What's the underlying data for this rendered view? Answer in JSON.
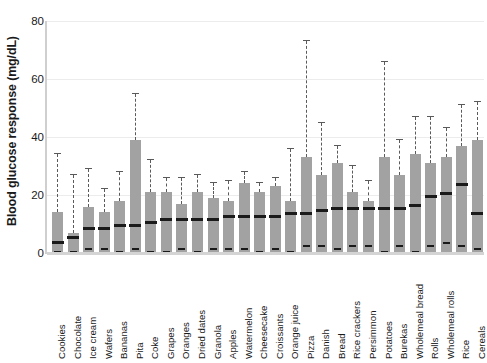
{
  "chart_data": {
    "type": "box",
    "title": "",
    "xlabel": "",
    "ylabel": "Blood glucose response (mg/dL)",
    "ylim": [
      0,
      80
    ],
    "yticks": [
      0,
      20,
      40,
      60,
      80
    ],
    "grid": true,
    "legend": null,
    "orientation": "vertical",
    "categories": [
      "Cookies",
      "Chocolate",
      "Ice cream",
      "Wafers",
      "Bananas",
      "Pita",
      "Coke",
      "Grapes",
      "Oranges",
      "Dried dates",
      "Granola",
      "Apples",
      "Watermelon",
      "Cheesecake",
      "Croissants",
      "Orange juice",
      "Pizza",
      "Danish",
      "Bread",
      "Rice crackers",
      "Persimmon",
      "Potatoes",
      "Burekas",
      "Wholemeal bread",
      "Rolls",
      "Wholemeal rolls",
      "Rice",
      "Cereals"
    ],
    "boxes": [
      {
        "label": "Cookies",
        "whisker_low": 0,
        "q1": 0,
        "median": 3,
        "q3": 14,
        "whisker_high": 34
      },
      {
        "label": "Chocolate",
        "whisker_low": 0,
        "q1": 0,
        "median": 5,
        "q3": 7,
        "whisker_high": 27
      },
      {
        "label": "Ice cream",
        "whisker_low": 1,
        "q1": 0,
        "median": 8,
        "q3": 16,
        "whisker_high": 29
      },
      {
        "label": "Wafers",
        "whisker_low": 1,
        "q1": 0,
        "median": 8,
        "q3": 14,
        "whisker_high": 22
      },
      {
        "label": "Bananas",
        "whisker_low": 0,
        "q1": 0,
        "median": 9,
        "q3": 18,
        "whisker_high": 28
      },
      {
        "label": "Pita",
        "whisker_low": 1,
        "q1": 0,
        "median": 9,
        "q3": 39,
        "whisker_high": 55
      },
      {
        "label": "Coke",
        "whisker_low": 0,
        "q1": 0,
        "median": 10,
        "q3": 21,
        "whisker_high": 32
      },
      {
        "label": "Grapes",
        "whisker_low": 0,
        "q1": 0,
        "median": 11,
        "q3": 21,
        "whisker_high": 26
      },
      {
        "label": "Oranges",
        "whisker_low": 1,
        "q1": 0,
        "median": 11,
        "q3": 17,
        "whisker_high": 26
      },
      {
        "label": "Dried dates",
        "whisker_low": 0,
        "q1": 0,
        "median": 11,
        "q3": 21,
        "whisker_high": 27
      },
      {
        "label": "Granola",
        "whisker_low": 1,
        "q1": 0,
        "median": 11,
        "q3": 19,
        "whisker_high": 24
      },
      {
        "label": "Apples",
        "whisker_low": 1,
        "q1": 0,
        "median": 12,
        "q3": 18,
        "whisker_high": 25
      },
      {
        "label": "Watermelon",
        "whisker_low": 1,
        "q1": 0,
        "median": 12,
        "q3": 24,
        "whisker_high": 28
      },
      {
        "label": "Cheesecake",
        "whisker_low": 0,
        "q1": 0,
        "median": 12,
        "q3": 21,
        "whisker_high": 24
      },
      {
        "label": "Croissants",
        "whisker_low": 1,
        "q1": 0,
        "median": 12,
        "q3": 23,
        "whisker_high": 26
      },
      {
        "label": "Orange juice",
        "whisker_low": 0,
        "q1": 0,
        "median": 13,
        "q3": 18,
        "whisker_high": 36
      },
      {
        "label": "Pizza",
        "whisker_low": 2,
        "q1": 0,
        "median": 13,
        "q3": 33,
        "whisker_high": 73
      },
      {
        "label": "Danish",
        "whisker_low": 2,
        "q1": 0,
        "median": 14,
        "q3": 27,
        "whisker_high": 45
      },
      {
        "label": "Bread",
        "whisker_low": 1,
        "q1": 0,
        "median": 15,
        "q3": 31,
        "whisker_high": 37
      },
      {
        "label": "Rice crackers",
        "whisker_low": 2,
        "q1": 0,
        "median": 15,
        "q3": 21,
        "whisker_high": 30
      },
      {
        "label": "Persimmon",
        "whisker_low": 2,
        "q1": 0,
        "median": 15,
        "q3": 18,
        "whisker_high": 25
      },
      {
        "label": "Potatoes",
        "whisker_low": 0,
        "q1": 0,
        "median": 15,
        "q3": 33,
        "whisker_high": 66
      },
      {
        "label": "Burekas",
        "whisker_low": 2,
        "q1": 0,
        "median": 15,
        "q3": 27,
        "whisker_high": 39
      },
      {
        "label": "Wholemeal bread",
        "whisker_low": 0,
        "q1": 0,
        "median": 16,
        "q3": 34,
        "whisker_high": 47
      },
      {
        "label": "Rolls",
        "whisker_low": 2,
        "q1": 0,
        "median": 19,
        "q3": 31,
        "whisker_high": 47
      },
      {
        "label": "Wholemeal rolls",
        "whisker_low": 3,
        "q1": 0,
        "median": 20,
        "q3": 33,
        "whisker_high": 43
      },
      {
        "label": "Rice",
        "whisker_low": 2,
        "q1": 0,
        "median": 23,
        "q3": 37,
        "whisker_high": 51
      },
      {
        "label": "Cereals",
        "whisker_low": 1,
        "q1": 0,
        "median": 13,
        "q3": 39,
        "whisker_high": 52
      }
    ]
  },
  "axis": {
    "y_tick_labels": [
      "0",
      "20",
      "40",
      "60",
      "80"
    ]
  }
}
